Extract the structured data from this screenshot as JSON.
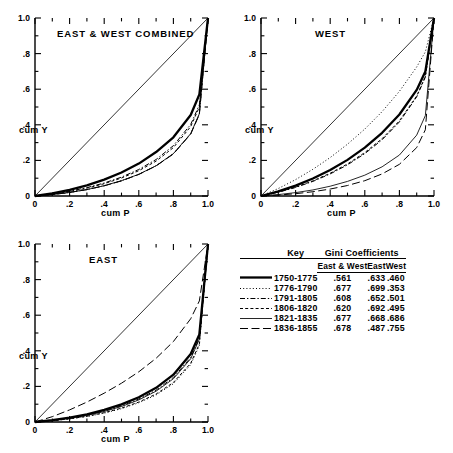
{
  "figure": {
    "panels": [
      {
        "id": "combined",
        "title": "EAST & WEST COMBINED",
        "xlabel": "cum P",
        "ylabel": "cum Y"
      },
      {
        "id": "west",
        "title": "WEST",
        "xlabel": "cum P",
        "ylabel": "cum Y"
      },
      {
        "id": "east",
        "title": "EAST",
        "xlabel": "cum P",
        "ylabel": "cum Y"
      }
    ],
    "axis_ticks": [
      "0",
      ".2",
      ".4",
      ".6",
      ".8",
      "1.0"
    ],
    "y_axis_ticks": [
      "0",
      ".2",
      ".4",
      ".6",
      ".8",
      "1.0"
    ]
  },
  "legend": {
    "title_key": "Key",
    "title_gini": "Gini  Coefficients",
    "columns": [
      "East & West",
      "East",
      "West"
    ],
    "rows": [
      {
        "period": "1750-1775",
        "style": "thick-solid",
        "east_west": ".561",
        "east": ".633",
        "west": ".460"
      },
      {
        "period": "1776-1790",
        "style": "dotted",
        "east_west": ".677",
        "east": ".699",
        "west": ".353"
      },
      {
        "period": "1791-1805",
        "style": "dash-dot",
        "east_west": ".608",
        "east": ".652",
        "west": ".501"
      },
      {
        "period": "1806-1820",
        "style": "dashed",
        "east_west": ".620",
        "east": ".692",
        "west": ".495"
      },
      {
        "period": "1821-1835",
        "style": "thin-solid",
        "east_west": ".677",
        "east": ".668",
        "west": ".686"
      },
      {
        "period": "1836-1855",
        "style": "long-dash",
        "east_west": ".678",
        "east": ".487",
        "west": ".755"
      }
    ]
  },
  "chart_data": {
    "type": "line",
    "xlabel": "cum P",
    "ylabel": "cum Y",
    "xlim": [
      0,
      1
    ],
    "ylim": [
      0,
      1
    ],
    "grid": false,
    "legend_position": "bottom-right-table",
    "x": [
      0,
      0.1,
      0.2,
      0.3,
      0.4,
      0.5,
      0.6,
      0.7,
      0.8,
      0.9,
      0.95,
      1.0
    ],
    "panels": [
      {
        "name": "EAST & WEST COMBINED",
        "series": [
          {
            "name": "1750-1775",
            "gini": 0.561,
            "style": "thick-solid",
            "values": [
              0,
              0.015,
              0.035,
              0.06,
              0.092,
              0.132,
              0.182,
              0.247,
              0.33,
              0.455,
              0.57,
              1.0
            ]
          },
          {
            "name": "1776-1790",
            "gini": 0.677,
            "style": "dotted",
            "values": [
              0,
              0.008,
              0.02,
              0.036,
              0.058,
              0.086,
              0.122,
              0.17,
              0.238,
              0.35,
              0.46,
              1.0
            ]
          },
          {
            "name": "1791-1805",
            "gini": 0.608,
            "style": "dash-dot",
            "values": [
              0,
              0.011,
              0.027,
              0.047,
              0.073,
              0.106,
              0.149,
              0.205,
              0.283,
              0.402,
              0.512,
              1.0
            ]
          },
          {
            "name": "1806-1820",
            "gini": 0.62,
            "style": "dashed",
            "values": [
              0,
              0.01,
              0.025,
              0.044,
              0.069,
              0.101,
              0.142,
              0.196,
              0.272,
              0.39,
              0.5,
              1.0
            ]
          },
          {
            "name": "1821-1835",
            "gini": 0.677,
            "style": "thin-solid",
            "values": [
              0,
              0.008,
              0.02,
              0.036,
              0.058,
              0.086,
              0.122,
              0.17,
              0.238,
              0.35,
              0.462,
              1.0
            ]
          },
          {
            "name": "1836-1855",
            "gini": 0.678,
            "style": "long-dash",
            "values": [
              0,
              0.008,
              0.02,
              0.036,
              0.057,
              0.085,
              0.121,
              0.169,
              0.236,
              0.348,
              0.458,
              1.0
            ]
          }
        ]
      },
      {
        "name": "WEST",
        "series": [
          {
            "name": "1750-1775",
            "gini": 0.46,
            "style": "thick-solid",
            "values": [
              0,
              0.026,
              0.058,
              0.098,
              0.146,
              0.203,
              0.272,
              0.355,
              0.458,
              0.596,
              0.7,
              1.0
            ]
          },
          {
            "name": "1776-1790",
            "gini": 0.353,
            "style": "dotted",
            "values": [
              0,
              0.042,
              0.092,
              0.15,
              0.216,
              0.291,
              0.376,
              0.474,
              0.588,
              0.725,
              0.81,
              1.0
            ]
          },
          {
            "name": "1791-1805",
            "gini": 0.501,
            "style": "dash-dot",
            "values": [
              0,
              0.021,
              0.048,
              0.082,
              0.124,
              0.175,
              0.238,
              0.316,
              0.416,
              0.557,
              0.668,
              1.0
            ]
          },
          {
            "name": "1806-1820",
            "gini": 0.495,
            "style": "dashed",
            "values": [
              0,
              0.022,
              0.05,
              0.085,
              0.128,
              0.18,
              0.244,
              0.322,
              0.422,
              0.562,
              0.672,
              1.0
            ]
          },
          {
            "name": "1821-1835",
            "gini": 0.686,
            "style": "thin-solid",
            "values": [
              0,
              0.008,
              0.019,
              0.034,
              0.055,
              0.082,
              0.117,
              0.164,
              0.23,
              0.342,
              0.452,
              1.0
            ]
          },
          {
            "name": "1836-1855",
            "gini": 0.755,
            "style": "long-dash",
            "values": [
              0,
              0.005,
              0.013,
              0.024,
              0.039,
              0.059,
              0.086,
              0.124,
              0.178,
              0.272,
              0.372,
              1.0
            ]
          }
        ]
      },
      {
        "name": "EAST",
        "series": [
          {
            "name": "1750-1775",
            "gini": 0.633,
            "style": "thick-solid",
            "values": [
              0,
              0.01,
              0.024,
              0.043,
              0.068,
              0.099,
              0.139,
              0.192,
              0.266,
              0.382,
              0.492,
              1.0
            ]
          },
          {
            "name": "1776-1790",
            "gini": 0.699,
            "style": "dotted",
            "values": [
              0,
              0.007,
              0.017,
              0.031,
              0.05,
              0.075,
              0.108,
              0.152,
              0.215,
              0.322,
              0.43,
              1.0
            ]
          },
          {
            "name": "1791-1805",
            "gini": 0.652,
            "style": "dash-dot",
            "values": [
              0,
              0.009,
              0.022,
              0.039,
              0.062,
              0.091,
              0.129,
              0.179,
              0.25,
              0.362,
              0.472,
              1.0
            ]
          },
          {
            "name": "1806-1820",
            "gini": 0.692,
            "style": "dashed",
            "values": [
              0,
              0.007,
              0.018,
              0.032,
              0.052,
              0.078,
              0.112,
              0.157,
              0.222,
              0.33,
              0.438,
              1.0
            ]
          },
          {
            "name": "1821-1835",
            "gini": 0.668,
            "style": "thin-solid",
            "values": [
              0,
              0.008,
              0.021,
              0.037,
              0.059,
              0.087,
              0.124,
              0.173,
              0.243,
              0.355,
              0.465,
              1.0
            ]
          },
          {
            "name": "1836-1855",
            "gini": 0.487,
            "style": "long-dash",
            "values": [
              0,
              0.03,
              0.068,
              0.112,
              0.162,
              0.218,
              0.282,
              0.358,
              0.452,
              0.58,
              0.68,
              1.0
            ]
          }
        ]
      }
    ]
  }
}
